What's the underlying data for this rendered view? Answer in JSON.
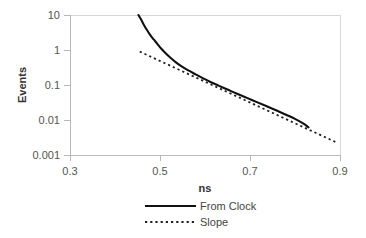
{
  "chart_data": {
    "type": "line",
    "title": "",
    "xlabel": "ns",
    "ylabel": "Events",
    "xlim": [
      0.3,
      0.9
    ],
    "ylim": [
      0.001,
      10
    ],
    "yscale": "log",
    "xscale": "linear",
    "grid": false,
    "legend_position": "bottom-center",
    "xticks": [
      "0.3",
      "0.5",
      "0.7",
      "0.9"
    ],
    "xtick_values": [
      0.3,
      0.5,
      0.7,
      0.9
    ],
    "yticks": [
      "10",
      "1",
      "0.1",
      "0.01",
      "0.001"
    ],
    "ytick_values": [
      10,
      1,
      0.1,
      0.01,
      0.001
    ],
    "series": [
      {
        "name": "From Clock",
        "style": "solid",
        "color": "#111111",
        "x": [
          0.452,
          0.458,
          0.464,
          0.47,
          0.478,
          0.486,
          0.494,
          0.502,
          0.512,
          0.522,
          0.534,
          0.548,
          0.562,
          0.578,
          0.594,
          0.612,
          0.63,
          0.65,
          0.67,
          0.692,
          0.714,
          0.736,
          0.758,
          0.78,
          0.8,
          0.818,
          0.83
        ],
        "y": [
          10.0,
          7.4,
          5.3,
          3.9,
          2.7,
          2.0,
          1.5,
          1.12,
          0.82,
          0.62,
          0.46,
          0.34,
          0.265,
          0.205,
          0.16,
          0.122,
          0.096,
          0.074,
          0.057,
          0.0435,
          0.033,
          0.025,
          0.019,
          0.0142,
          0.0108,
          0.008,
          0.0062
        ]
      },
      {
        "name": "Slope",
        "style": "dotted",
        "color": "#222222",
        "x": [
          0.455,
          0.895
        ],
        "y": [
          0.9,
          0.0022
        ]
      }
    ],
    "legend": [
      {
        "label": "From Clock",
        "style": "solid"
      },
      {
        "label": "Slope",
        "style": "dotted"
      }
    ]
  }
}
